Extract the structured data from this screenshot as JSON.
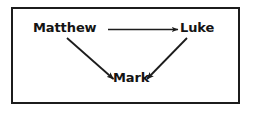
{
  "diagram": {
    "type": "directed-graph",
    "background_color": "#ffffff",
    "border_color": "#1c1c1c",
    "text_color": "#141414",
    "arrow_color": "#1c1c1c",
    "nodes": [
      {
        "id": "matthew",
        "label": "Matthew",
        "x": 33,
        "y": 21
      },
      {
        "id": "luke",
        "label": "Luke",
        "x": 180,
        "y": 21
      },
      {
        "id": "mark",
        "label": "Mark",
        "x": 113,
        "y": 71
      }
    ],
    "edges": [
      {
        "id": "matthew-to-luke",
        "from": "Matthew",
        "to": "Luke",
        "label": "",
        "style": "solid",
        "arrowhead": "filled-triangle"
      },
      {
        "id": "matthew-to-mark",
        "from": "Matthew",
        "to": "Mark",
        "label": "",
        "style": "solid",
        "arrowhead": "filled-triangle"
      },
      {
        "id": "luke-to-mark",
        "from": "Luke",
        "to": "Mark",
        "label": "",
        "style": "solid",
        "arrowhead": "filled-triangle"
      }
    ]
  }
}
